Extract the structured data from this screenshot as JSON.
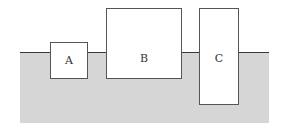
{
  "diagram": {
    "ground": {
      "color": "#d6d6d6",
      "line_color": "#3a3a3a"
    },
    "blocks": [
      {
        "label": "A",
        "x": 50,
        "y": 42,
        "w": 38,
        "h": 37
      },
      {
        "label": "B",
        "x": 106,
        "y": 8,
        "w": 76,
        "h": 71
      },
      {
        "label": "C",
        "x": 199,
        "y": 8,
        "w": 40,
        "h": 97
      }
    ]
  }
}
